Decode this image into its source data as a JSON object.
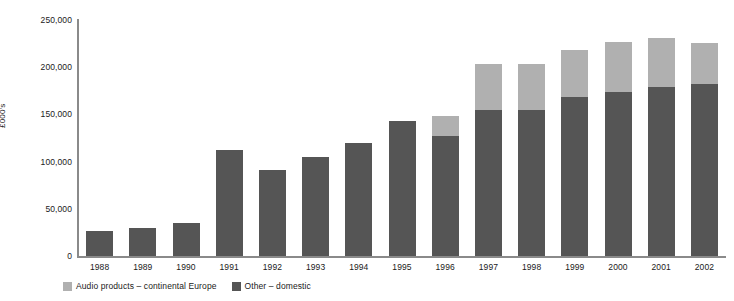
{
  "chart_data": {
    "type": "bar",
    "stacked": true,
    "title": "",
    "xlabel": "",
    "ylabel": "£000's",
    "ylim": [
      0,
      250000
    ],
    "yticks": [
      "0",
      "50,000",
      "100,000",
      "150,000",
      "200,000",
      "250,000"
    ],
    "ytick_values": [
      0,
      50000,
      100000,
      150000,
      200000,
      250000
    ],
    "grid": false,
    "legend_position": "bottom-left",
    "categories": [
      "1988",
      "1989",
      "1990",
      "1991",
      "1992",
      "1993",
      "1994",
      "1995",
      "1996",
      "1997",
      "1998",
      "1999",
      "2000",
      "2001",
      "2002"
    ],
    "series": [
      {
        "name": "Other – domestic",
        "color": "#555555",
        "values": [
          26000,
          30000,
          35000,
          112000,
          91000,
          105000,
          120000,
          143000,
          127000,
          155000,
          155000,
          168000,
          174000,
          179000,
          182000
        ]
      },
      {
        "name": "Audio products – continental Europe",
        "color": "#b0b0b0",
        "values": [
          0,
          0,
          0,
          0,
          0,
          0,
          0,
          0,
          21000,
          48000,
          48000,
          50000,
          53000,
          52000,
          44000
        ]
      }
    ],
    "totals": [
      26000,
      30000,
      35000,
      112000,
      91000,
      105000,
      120000,
      143000,
      148000,
      203000,
      203000,
      218000,
      227000,
      231000,
      226000
    ]
  },
  "legend": {
    "items": [
      {
        "label": "Audio products – continental Europe",
        "color": "#b0b0b0"
      },
      {
        "label": "Other – domestic",
        "color": "#555555"
      }
    ]
  },
  "axis": {
    "y_title": "£000's"
  }
}
